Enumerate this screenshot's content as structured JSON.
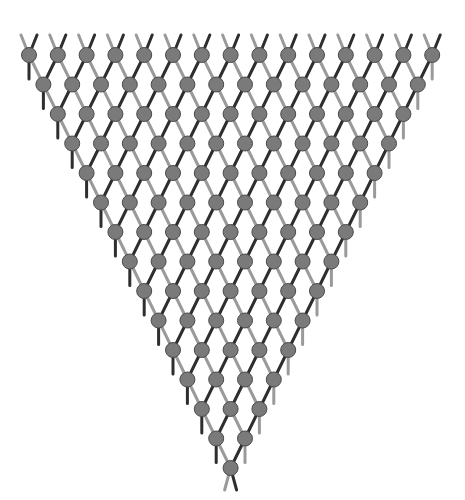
{
  "diagram": {
    "type": "inverted-triangular-lattice",
    "rows": 15,
    "top_row_nodes": 15,
    "origin": {
      "x": 29,
      "y": 55
    },
    "dx": 28.8,
    "dy": 29.5,
    "node_radius": 7.5,
    "stub_length": 20,
    "colors": {
      "background": "#ffffff",
      "node_fill": "#7a7a7a",
      "node_stroke": "#4a4a4a",
      "edge_dark": "#2e2e2e",
      "edge_light": "#9a9a9a"
    }
  }
}
